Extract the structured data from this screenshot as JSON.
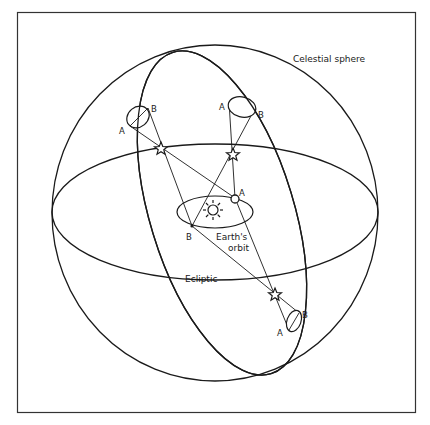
{
  "figure": {
    "colors": {
      "ink": "#1a1a1a",
      "background": "#ffffff"
    },
    "labels": {
      "celestial_sphere": "Celestial sphere",
      "earths_orbit_line1": "Earth's",
      "earths_orbit_line2": "orbit",
      "ecliptic": "Ecliptic"
    },
    "points": {
      "earth_A": "A",
      "earth_B": "B",
      "star1_A": "A",
      "star1_B": "B",
      "star2_A": "A",
      "star2_B": "B",
      "star3_A": "A",
      "star3_B": "B"
    },
    "icons": {
      "sun": "sun-icon",
      "star": "star-icon"
    }
  }
}
